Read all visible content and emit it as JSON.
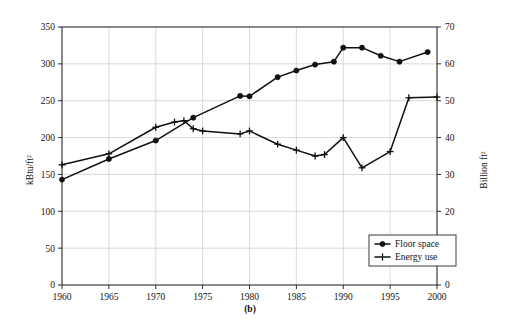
{
  "figure": {
    "subfigure_label": "(b)",
    "background_color": "#ffffff",
    "ink_color": "#101010",
    "grid_color": "#c9c9c9"
  },
  "chart_data": {
    "type": "line",
    "title": "",
    "subtitle": "",
    "xlabel": "",
    "ylabel": "kBtu/ft²",
    "y2label": "Billion ft²",
    "xlim": [
      1960,
      2000
    ],
    "ylim": [
      0,
      350
    ],
    "y2lim": [
      0,
      70
    ],
    "grid": true,
    "legend_position": "bottom-right",
    "x_ticks": [
      1960,
      1965,
      1970,
      1975,
      1980,
      1985,
      1990,
      1995,
      2000
    ],
    "x_tick_labels": [
      "1960",
      "1965",
      "1970",
      "1975",
      "1980",
      "1985",
      "1990",
      "1995",
      "2000"
    ],
    "y_ticks": [
      0,
      50,
      100,
      150,
      200,
      250,
      300,
      350
    ],
    "y_tick_labels": [
      "0",
      "50",
      "100",
      "150",
      "200",
      "250",
      "300",
      "350"
    ],
    "y2_ticks": [
      0,
      10,
      20,
      30,
      40,
      50,
      60,
      70
    ],
    "y2_tick_labels": [
      "0",
      "10",
      "20",
      "30",
      "40",
      "50",
      "60",
      "70"
    ],
    "series": [
      {
        "name": "Floor space",
        "axis": "right",
        "marker": "filled-circle",
        "units": "Billion ft²",
        "x": [
          1960,
          1965,
          1970,
          1974,
          1979,
          1980,
          1983,
          1985,
          1987,
          1989,
          1990,
          1992,
          1994,
          1996,
          1999
        ],
        "values": [
          28.6,
          34.2,
          39.2,
          45.4,
          51.3,
          51.2,
          56.4,
          58.2,
          59.8,
          60.6,
          64.4,
          64.4,
          62.2,
          60.6,
          63.2
        ]
      },
      {
        "name": "Energy use",
        "axis": "left",
        "marker": "plus",
        "units": "kBtu/ft²",
        "x": [
          1960,
          1965,
          1970,
          1972,
          1973,
          1974,
          1975,
          1979,
          1980,
          1983,
          1985,
          1987,
          1988,
          1990,
          1992,
          1995,
          1997,
          2000
        ],
        "values": [
          163,
          178,
          214,
          221,
          223,
          212,
          209,
          205,
          209,
          191,
          183,
          175,
          177,
          200,
          159,
          181,
          254,
          255
        ]
      }
    ]
  },
  "legend": {
    "items": [
      {
        "label": "Floor space",
        "marker": "filled-circle"
      },
      {
        "label": "Energy use",
        "marker": "plus"
      }
    ]
  }
}
